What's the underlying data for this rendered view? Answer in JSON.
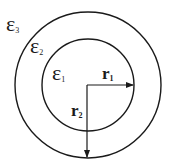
{
  "diagram": {
    "colors": {
      "stroke": "#1a1a1a",
      "background": "#ffffff"
    },
    "regions": [
      {
        "id": "eps3",
        "symbol": "ε",
        "subscript": "3"
      },
      {
        "id": "eps2",
        "symbol": "ε",
        "subscript": "2"
      },
      {
        "id": "eps1",
        "symbol": "ε",
        "subscript": "1"
      }
    ],
    "radii": [
      {
        "id": "r1",
        "symbol": "r",
        "subscript": "1"
      },
      {
        "id": "r2",
        "symbol": "r",
        "subscript": "2"
      }
    ]
  }
}
